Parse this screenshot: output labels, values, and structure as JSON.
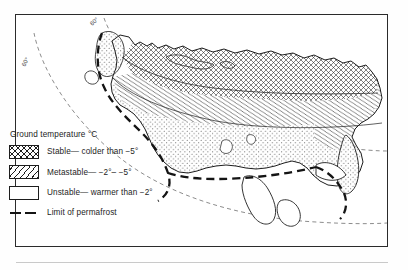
{
  "figure": {
    "panel_label": "A",
    "latitude_labels": [
      "60°",
      "60°"
    ]
  },
  "legend": {
    "title": "Ground temperature °C",
    "items": [
      {
        "pattern": "cross-hatch",
        "label": "Stable— colder than −5°"
      },
      {
        "pattern": "diagonal-hatch",
        "label": "Metastable— −2°– −5°"
      },
      {
        "pattern": "stipple",
        "label": "Unstable— warmer than −2°"
      }
    ],
    "limit": {
      "style": "thick-dashed",
      "label": "Limit of permafrost"
    }
  },
  "colors": {
    "ink": "#1d1d1d",
    "frame": "#2b2b2b",
    "paper": "#ffffff",
    "rule": "#c9c9c9"
  },
  "map": {
    "region": "northern Eurasia permafrost distribution",
    "zones": [
      {
        "name": "stable",
        "pattern": "cross-hatch"
      },
      {
        "name": "metastable",
        "pattern": "diagonal-hatch"
      },
      {
        "name": "unstable",
        "pattern": "stipple"
      }
    ],
    "graticule": "dashed latitude arcs",
    "permafrost_limit": "thick dashed boundary"
  }
}
